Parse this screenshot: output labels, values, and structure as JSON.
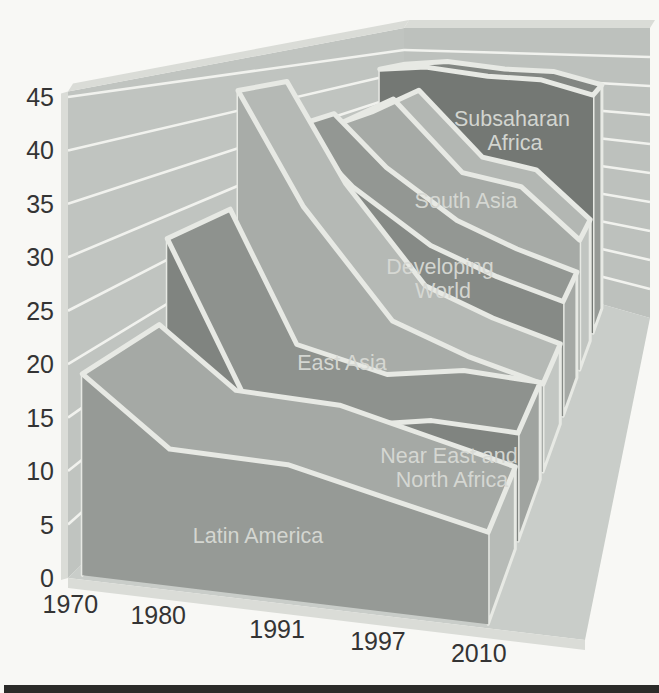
{
  "page": {
    "background": "#f8f8f5",
    "bottom_rule_color": "#2b2b29"
  },
  "chart_data": {
    "type": "area",
    "projection": "3d-perspective-ribbons",
    "title": "",
    "categories": [
      "1970",
      "1980",
      "1991",
      "1997",
      "2010"
    ],
    "xlabel": "",
    "ylabel": "",
    "ylim": [
      0,
      45
    ],
    "y_ticks": [
      0,
      5,
      10,
      15,
      20,
      25,
      30,
      35,
      40,
      45
    ],
    "grid": true,
    "legend_position": "labels-on-ribbons",
    "series": [
      {
        "name": "Latin America",
        "values": [
          19,
          13,
          13,
          11,
          9
        ],
        "label_lines": [
          "Latin America"
        ],
        "label_x": 258,
        "label_y": 543,
        "face": "#969a96",
        "top": "#a5a9a5",
        "cap": "#b7bbb7"
      },
      {
        "name": "Near East and North Africa",
        "values": [
          28,
          12,
          10,
          12,
          12
        ],
        "label_lines": [
          "Near East and",
          "North Africa"
        ],
        "label_x": 449,
        "label_y": 463,
        "face": "#808480",
        "top": "#8e928e",
        "cap": "#a0a4a0"
      },
      {
        "name": "East Asia",
        "values": [
          43,
          29,
          16,
          13,
          11
        ],
        "label_lines": [
          "East Asia"
        ],
        "label_x": 342,
        "label_y": 370,
        "face": "#a8aca8",
        "top": "#b5b9b5",
        "cap": "#c3c7c3"
      },
      {
        "name": "Developing World",
        "values": [
          36,
          28,
          21,
          18,
          16
        ],
        "label_lines": [
          "Developing",
          "World"
        ],
        "label_x": 440,
        "label_y": 274,
        "face": "#868a86",
        "top": "#939793",
        "cap": "#a5a9a5"
      },
      {
        "name": "South Asia",
        "values": [
          34,
          39,
          28,
          27,
          20
        ],
        "label_lines": [
          "South Asia"
        ],
        "label_x": 466,
        "label_y": 208,
        "face": "#a6aaa6",
        "top": "#b3b7b3",
        "cap": "#c1c5c1"
      },
      {
        "name": "Subsaharan Africa",
        "values": [
          42,
          43,
          42,
          42,
          40
        ],
        "label_lines": [
          "Subsaharan",
          "Africa"
        ],
        "label_x": 512,
        "label_y": 126,
        "face": "#747874",
        "top": "#828682",
        "cap": "#969a96"
      }
    ]
  },
  "colors": {
    "left_wall": "#c0c4c0",
    "back_wall": "#bdc1bd",
    "floor": "#c9cdc9",
    "rim": "#dadcd7",
    "gridline": "#f1f2ee",
    "white_edge": "#e7e9e4",
    "axis_text": "#343434",
    "series_label_text": "#d8dad5"
  }
}
